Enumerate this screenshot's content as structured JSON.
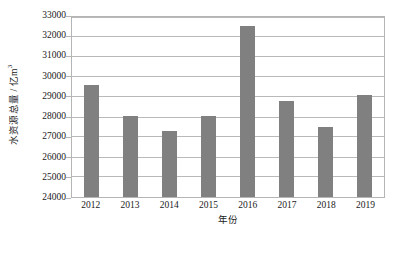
{
  "chart_data": {
    "type": "bar",
    "title": "",
    "subtitle": "",
    "xlabel": "年份",
    "ylabel": "水资源总量 / 亿m³",
    "ylabel_main": "水资源总量 / 亿m",
    "ylabel_exponent": "3",
    "categories": [
      "2012",
      "2013",
      "2014",
      "2015",
      "2016",
      "2017",
      "2018",
      "2019"
    ],
    "values": [
      29530,
      28000,
      27270,
      28000,
      32466,
      28760,
      27460,
      29040
    ],
    "series": [
      {
        "name": "水资源总量",
        "values": [
          29530,
          28000,
          27270,
          28000,
          32466,
          28760,
          27460,
          29040
        ]
      }
    ],
    "ylim": [
      24000,
      33000
    ],
    "ytick_step": 1000,
    "yticks": [
      24000,
      25000,
      26000,
      27000,
      28000,
      29000,
      30000,
      31000,
      32000,
      33000
    ],
    "ytick_labels": [
      "24000",
      "25000",
      "26000",
      "27000",
      "28000",
      "29000",
      "30000",
      "31000",
      "32000",
      "33000"
    ],
    "grid": true,
    "grid_axis": "y",
    "legend": false,
    "legend_position": "none",
    "bar_color": "#808080",
    "plot_border_color": "#b5b5b5",
    "gridline_color": "#b9b9b9",
    "background_color": "#ffffff"
  }
}
